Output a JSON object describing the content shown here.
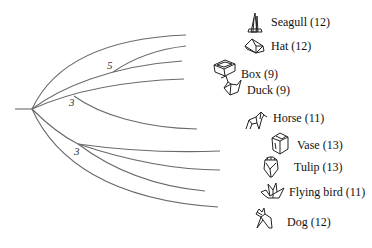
{
  "diagram": {
    "type": "phylogenetic-tree",
    "internal_nodes": [
      {
        "id": "n5",
        "label": "5"
      },
      {
        "id": "n3a",
        "label": "3"
      },
      {
        "id": "n3b",
        "label": "3"
      }
    ],
    "leaves": [
      {
        "id": "seagull",
        "name": "Seagull",
        "count": 12,
        "label": "Seagull (12)",
        "icon": "seagull-icon"
      },
      {
        "id": "hat",
        "name": "Hat",
        "count": 12,
        "label": "Hat (12)",
        "icon": "hat-icon"
      },
      {
        "id": "box",
        "name": "Box",
        "count": 9,
        "label": "Box (9)",
        "icon": "box-icon"
      },
      {
        "id": "duck",
        "name": "Duck",
        "count": 9,
        "label": "Duck (9)",
        "icon": "duck-icon"
      },
      {
        "id": "horse",
        "name": "Horse",
        "count": 11,
        "label": "Horse (11)",
        "icon": "horse-icon"
      },
      {
        "id": "vase",
        "name": "Vase",
        "count": 13,
        "label": "Vase (13)",
        "icon": "vase-icon"
      },
      {
        "id": "tulip",
        "name": "Tulip",
        "count": 13,
        "label": "Tulip (13)",
        "icon": "tulip-icon"
      },
      {
        "id": "flying_bird",
        "name": "Flying bird",
        "count": 11,
        "label": "Flying bird (11)",
        "icon": "flying-bird-icon"
      },
      {
        "id": "dog",
        "name": "Dog",
        "count": 12,
        "label": "Dog (12)",
        "icon": "dog-icon"
      }
    ]
  }
}
